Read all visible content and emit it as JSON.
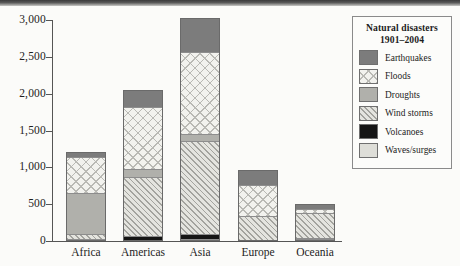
{
  "chart_data": {
    "type": "bar",
    "subtype": "stacked-bar",
    "title": "Natural disasters 1901–2004",
    "xlabel": "",
    "ylabel": "",
    "ylim": [
      0,
      3000
    ],
    "yticks": [
      0,
      500,
      1000,
      1500,
      2000,
      2500,
      3000
    ],
    "ytick_labels": [
      "0",
      "500",
      "1,000",
      "1,500",
      "2,000",
      "2,500",
      "3,000"
    ],
    "grid": false,
    "legend_position": "right",
    "legend_title_line1": "Natural disasters",
    "legend_title_line2": "1901–2004",
    "categories": [
      "Africa",
      "Americas",
      "Asia",
      "Europe",
      "Oceania"
    ],
    "stack_order_bottom_to_top": [
      "Waves/surges",
      "Volcanoes",
      "Wind storms",
      "Droughts",
      "Floods",
      "Earthquakes"
    ],
    "series": [
      {
        "name": "Waves/surges",
        "pattern": "p-waves",
        "color": "#dedeD8",
        "values": [
          0,
          0,
          20,
          0,
          10
        ]
      },
      {
        "name": "Volcanoes",
        "pattern": "p-volcanoes",
        "color": "#151515",
        "values": [
          5,
          60,
          55,
          0,
          10
        ]
      },
      {
        "name": "Wind storms",
        "pattern": "p-windstorms",
        "color": "#e4e4df",
        "values": [
          75,
          800,
          1270,
          330,
          340
        ]
      },
      {
        "name": "Droughts",
        "pattern": "p-droughts",
        "color": "#b0b0ab",
        "values": [
          560,
          100,
          90,
          0,
          0
        ]
      },
      {
        "name": "Floods",
        "pattern": "p-floods",
        "color": "#f2f2ee",
        "values": [
          480,
          840,
          1120,
          420,
          60
        ]
      },
      {
        "name": "Earthquakes",
        "pattern": "p-earthquakes",
        "color": "#7c7c7c",
        "values": [
          60,
          225,
          445,
          190,
          50
        ]
      }
    ],
    "totals": [
      1180,
      2025,
      3000,
      940,
      470
    ]
  },
  "legend": {
    "entries": [
      {
        "label": "Earthquakes",
        "pattern": "p-earthquakes"
      },
      {
        "label": "Floods",
        "pattern": "p-floods"
      },
      {
        "label": "Droughts",
        "pattern": "p-droughts"
      },
      {
        "label": "Wind storms",
        "pattern": "p-windstorms"
      },
      {
        "label": "Volcanoes",
        "pattern": "p-volcanoes"
      },
      {
        "label": "Waves/surges",
        "pattern": "p-waves"
      }
    ]
  }
}
